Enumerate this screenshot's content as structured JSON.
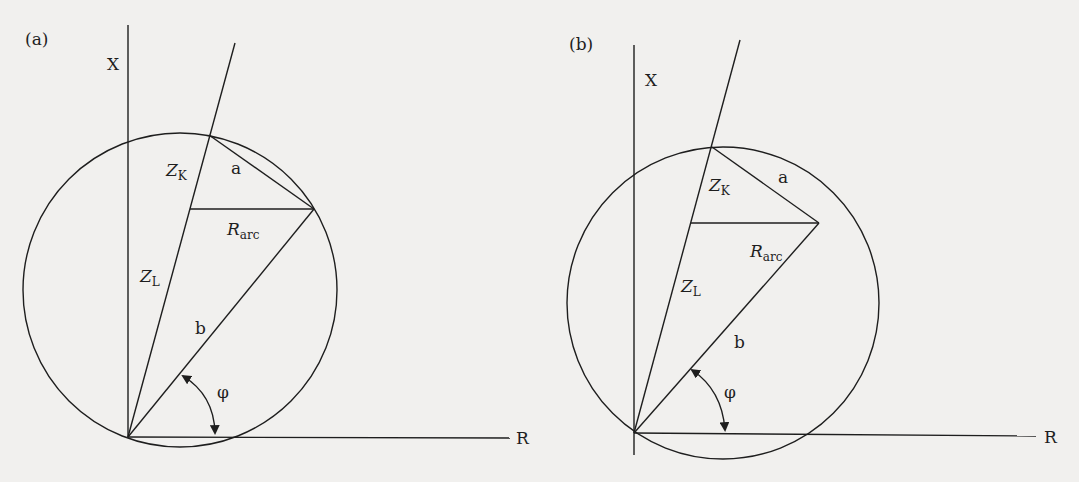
{
  "panels": [
    {
      "id": "a",
      "label": "(a)",
      "x_axis_label": "X",
      "r_axis_label": "R",
      "zk_main": "Z",
      "zk_sub": "K",
      "zl_main": "Z",
      "zl_sub": "L",
      "rarc_main": "R",
      "rarc_sub": "arc",
      "a_label": "a",
      "b_label": "b",
      "phi_label": "φ"
    },
    {
      "id": "b",
      "label": "(b)",
      "x_axis_label": "X",
      "r_axis_label": "R",
      "zk_main": "Z",
      "zk_sub": "K",
      "zl_main": "Z",
      "zl_sub": "L",
      "rarc_main": "R",
      "rarc_sub": "arc",
      "a_label": "a",
      "b_label": "b",
      "phi_label": "φ"
    }
  ]
}
